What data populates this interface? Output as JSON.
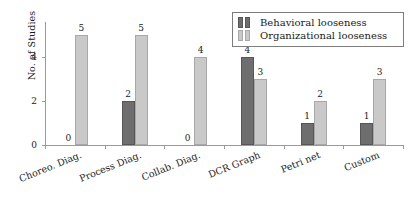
{
  "chart_data": {
    "type": "bar",
    "title": "",
    "xlabel": "",
    "ylabel": "No. of Studies",
    "ylim": [
      0,
      5.6
    ],
    "yticks": [
      "0",
      "2",
      "4"
    ],
    "ytick_values": [
      0,
      2,
      4
    ],
    "grid": false,
    "legend_position": "top-right",
    "categories": [
      "Choreo. Diag.",
      "Process Diag.",
      "Collab. Diag.",
      "DCR Graph",
      "Petri net",
      "Custom"
    ],
    "series": [
      {
        "name": "Behavioral looseness",
        "color": "#6e6e6e",
        "values": [
          0,
          2,
          0,
          4,
          1,
          1
        ]
      },
      {
        "name": "Organizational looseness",
        "color": "#c9c9c9",
        "values": [
          5,
          5,
          4,
          3,
          2,
          3
        ]
      }
    ]
  },
  "legend": {
    "items": [
      {
        "label": "Behavioral looseness"
      },
      {
        "label": "Organizational looseness"
      }
    ]
  }
}
